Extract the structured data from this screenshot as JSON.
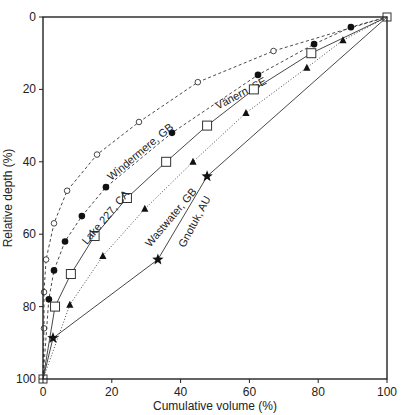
{
  "chart_data": {
    "type": "line",
    "title": "",
    "xlabel": "Cumulative volume (%)",
    "ylabel": "Relative depth (%)",
    "xlim": [
      0,
      100
    ],
    "ylim": [
      0,
      100
    ],
    "y_inverted": true,
    "grid": false,
    "legend": "none (inline curve labels)",
    "x_ticks": [
      0,
      20,
      40,
      60,
      80,
      100
    ],
    "y_ticks": [
      0,
      20,
      40,
      60,
      80,
      100
    ],
    "series": [
      {
        "name": "Vänern, SE",
        "marker": "open-circle",
        "line": "dashed",
        "points": [
          [
            0,
            100
          ],
          [
            0.3,
            86
          ],
          [
            0.3,
            76
          ],
          [
            0.9,
            67
          ],
          [
            3.2,
            57
          ],
          [
            7,
            48
          ],
          [
            15.7,
            38
          ],
          [
            27.9,
            29
          ],
          [
            45,
            18
          ],
          [
            67,
            9.4
          ],
          [
            100,
            0
          ]
        ],
        "label_pos": [
          58,
          22
        ],
        "label_angle": -28
      },
      {
        "name": "Windermere, GB",
        "marker": "filled-circle",
        "line": "dashed",
        "points": [
          [
            0,
            100
          ],
          [
            1.7,
            78
          ],
          [
            3.2,
            70
          ],
          [
            6.4,
            62
          ],
          [
            11.3,
            55
          ],
          [
            18.3,
            47
          ],
          [
            37.5,
            32
          ],
          [
            62.5,
            16
          ],
          [
            78.8,
            7.5
          ],
          [
            89.5,
            2.8
          ],
          [
            100,
            0
          ]
        ],
        "label_pos": [
          29,
          38
        ],
        "label_angle": -40
      },
      {
        "name": "Lake 227, CA",
        "marker": "open-square",
        "line": "solid",
        "points": [
          [
            0,
            100
          ],
          [
            3.5,
            80
          ],
          [
            8.1,
            71
          ],
          [
            15,
            60.5
          ],
          [
            24.4,
            50
          ],
          [
            35.8,
            40
          ],
          [
            47.7,
            30
          ],
          [
            61.3,
            20
          ],
          [
            78,
            10
          ],
          [
            100,
            0
          ]
        ],
        "label_pos": [
          19,
          56
        ],
        "label_angle": -50
      },
      {
        "name": "Wastwater, GB",
        "marker": "filled-triangle",
        "line": "dotted",
        "points": [
          [
            0,
            100
          ],
          [
            7.8,
            79.5
          ],
          [
            17.4,
            66
          ],
          [
            29.6,
            53
          ],
          [
            43.6,
            40
          ],
          [
            59,
            26.5
          ],
          [
            76.7,
            14
          ],
          [
            87.2,
            6.4
          ],
          [
            100,
            0
          ]
        ],
        "label_pos": [
          38,
          56
        ],
        "label_angle": -50
      },
      {
        "name": "Gnotuk, AU",
        "marker": "star",
        "line": "solid",
        "points": [
          [
            0,
            100
          ],
          [
            2.9,
            88.7
          ],
          [
            33.4,
            67
          ],
          [
            47.7,
            44
          ],
          [
            100,
            0
          ]
        ],
        "label_pos": [
          45,
          57
        ],
        "label_angle": -62
      }
    ]
  }
}
